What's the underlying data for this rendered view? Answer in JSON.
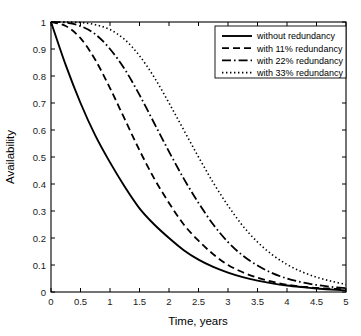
{
  "chart_data": {
    "type": "line",
    "title": "",
    "xlabel": "Time, years",
    "ylabel": "Availability",
    "xlim": [
      0,
      5
    ],
    "ylim": [
      0,
      1
    ],
    "grid": false,
    "legend_position": "top-right",
    "xticks": [
      "0",
      "0.5",
      "1",
      "1.5",
      "2",
      "2.5",
      "3",
      "3.5",
      "4",
      "4.5",
      "5"
    ],
    "xtick_values": [
      0,
      0.5,
      1,
      1.5,
      2,
      2.5,
      3,
      3.5,
      4,
      4.5,
      5
    ],
    "yticks": [
      "0",
      "0.1",
      "0.2",
      "0.3",
      "0.4",
      "0.5",
      "0.6",
      "0.7",
      "0.8",
      "0.9",
      "1"
    ],
    "ytick_values": [
      0,
      0.1,
      0.2,
      0.3,
      0.4,
      0.5,
      0.6,
      0.7,
      0.8,
      0.9,
      1
    ],
    "x": [
      0,
      0.25,
      0.5,
      0.75,
      1,
      1.25,
      1.5,
      1.75,
      2,
      2.25,
      2.5,
      2.75,
      3,
      3.25,
      3.5,
      3.75,
      4,
      4.25,
      4.5,
      4.75,
      5
    ],
    "series": [
      {
        "name": "without redundancy",
        "style": "solid",
        "color": "#000000",
        "values": [
          1.0,
          0.84,
          0.7,
          0.58,
          0.48,
          0.39,
          0.31,
          0.25,
          0.2,
          0.155,
          0.12,
          0.093,
          0.072,
          0.055,
          0.042,
          0.032,
          0.024,
          0.018,
          0.013,
          0.009,
          0.006
        ]
      },
      {
        "name": "with 11% redundancy",
        "style": "dashed",
        "color": "#000000",
        "values": [
          1.0,
          0.985,
          0.94,
          0.86,
          0.755,
          0.64,
          0.525,
          0.42,
          0.33,
          0.25,
          0.19,
          0.14,
          0.1,
          0.073,
          0.053,
          0.038,
          0.027,
          0.02,
          0.015,
          0.012,
          0.01
        ]
      },
      {
        "name": "with 22% redundancy",
        "style": "dashdot",
        "color": "#000000",
        "values": [
          1.0,
          0.998,
          0.985,
          0.955,
          0.9,
          0.825,
          0.73,
          0.625,
          0.52,
          0.42,
          0.33,
          0.25,
          0.185,
          0.135,
          0.098,
          0.07,
          0.05,
          0.036,
          0.026,
          0.019,
          0.014
        ]
      },
      {
        "name": "with 33% redundancy",
        "style": "dotted",
        "color": "#000000",
        "values": [
          1.0,
          1.0,
          0.998,
          0.99,
          0.972,
          0.935,
          0.875,
          0.795,
          0.7,
          0.6,
          0.5,
          0.405,
          0.32,
          0.245,
          0.185,
          0.138,
          0.102,
          0.075,
          0.055,
          0.04,
          0.028
        ]
      }
    ]
  }
}
